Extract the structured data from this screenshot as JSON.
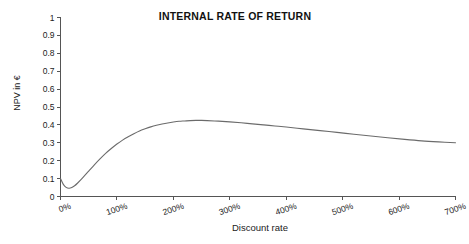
{
  "chart_data": {
    "type": "line",
    "title": "INTERNAL RATE OF RETURN",
    "xlabel": "Discount rate",
    "ylabel": "NPV in €",
    "xlim": [
      0,
      700
    ],
    "ylim": [
      0,
      1
    ],
    "grid": false,
    "legend": "none",
    "line_color": "#6b6b6b",
    "x_tick_labels": [
      "0%",
      "100%",
      "200%",
      "300%",
      "400%",
      "500%",
      "600%",
      "700%"
    ],
    "x_tick_values": [
      0,
      100,
      200,
      300,
      400,
      500,
      600,
      700
    ],
    "y_tick_labels": [
      "0",
      "0.1",
      "0.2",
      "0.3",
      "0.4",
      "0.5",
      "0.6",
      "0.7",
      "0.8",
      "0.9",
      "1"
    ],
    "y_tick_values": [
      0,
      0.1,
      0.2,
      0.3,
      0.4,
      0.5,
      0.6,
      0.7,
      0.8,
      0.9,
      1
    ],
    "series": [
      {
        "name": "NPV",
        "x": [
          0,
          5,
          10,
          15,
          20,
          25,
          30,
          40,
          50,
          60,
          70,
          80,
          90,
          100,
          110,
          120,
          130,
          140,
          150,
          160,
          170,
          180,
          190,
          200,
          210,
          220,
          230,
          240,
          250,
          260,
          280,
          300,
          320,
          340,
          360,
          380,
          400,
          430,
          460,
          490,
          520,
          550,
          580,
          610,
          640,
          670,
          700
        ],
        "y": [
          0.1,
          0.068,
          0.051,
          0.046,
          0.05,
          0.06,
          0.074,
          0.107,
          0.142,
          0.177,
          0.21,
          0.241,
          0.268,
          0.293,
          0.315,
          0.334,
          0.351,
          0.366,
          0.378,
          0.389,
          0.398,
          0.405,
          0.411,
          0.416,
          0.42,
          0.422,
          0.424,
          0.425,
          0.425,
          0.424,
          0.421,
          0.417,
          0.412,
          0.406,
          0.4,
          0.394,
          0.388,
          0.378,
          0.368,
          0.358,
          0.348,
          0.338,
          0.328,
          0.319,
          0.311,
          0.305,
          0.3
        ]
      }
    ],
    "annotations": []
  }
}
